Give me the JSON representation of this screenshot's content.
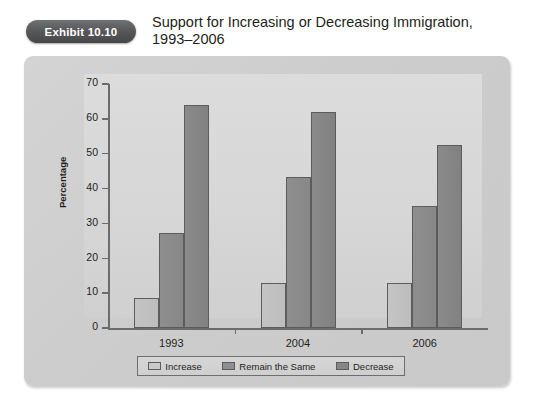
{
  "header": {
    "badge_label": "Exhibit 10.10",
    "title": "Support for Increasing or Decreasing Immigration, 1993–2006"
  },
  "chart_data": {
    "type": "bar",
    "title": "Support for Increasing or Decreasing Immigration, 1993–2006",
    "xlabel": "",
    "ylabel": "Percentage",
    "ylim": [
      0,
      70
    ],
    "yticks": [
      0,
      10,
      20,
      30,
      40,
      50,
      60,
      70
    ],
    "grid": false,
    "legend_position": "bottom",
    "categories": [
      "1993",
      "2004",
      "2006"
    ],
    "series": [
      {
        "name": "Increase",
        "values": [
          8.5,
          13,
          12.8
        ],
        "color": "#c4c4c4"
      },
      {
        "name": "Remain the Same",
        "values": [
          27.3,
          43.3,
          35
        ],
        "color": "#8e8e8e"
      },
      {
        "name": "Decrease",
        "values": [
          64,
          62,
          52.5
        ],
        "color": "#868686"
      }
    ]
  }
}
